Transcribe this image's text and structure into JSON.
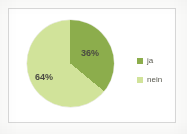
{
  "chart_data": {
    "type": "pie",
    "title": "",
    "categories": [
      "ja",
      "nein"
    ],
    "values": [
      36,
      64
    ],
    "value_labels": [
      "36%",
      "64%"
    ],
    "colors": [
      "#8CAD4C",
      "#D1E39A"
    ],
    "legend": {
      "position": "right",
      "entries": [
        {
          "label": "ja",
          "color": "#8CAD4C",
          "swatch": "legend-swatch-ja"
        },
        {
          "label": "nein",
          "color": "#D1E39A",
          "swatch": "legend-swatch-nein"
        }
      ]
    },
    "start_angle_deg": 0,
    "direction": "clockwise",
    "grid": false,
    "xlabel": "",
    "ylabel": ""
  },
  "frame": {
    "border_color": "#d8d8d8",
    "background": "#ffffff"
  }
}
